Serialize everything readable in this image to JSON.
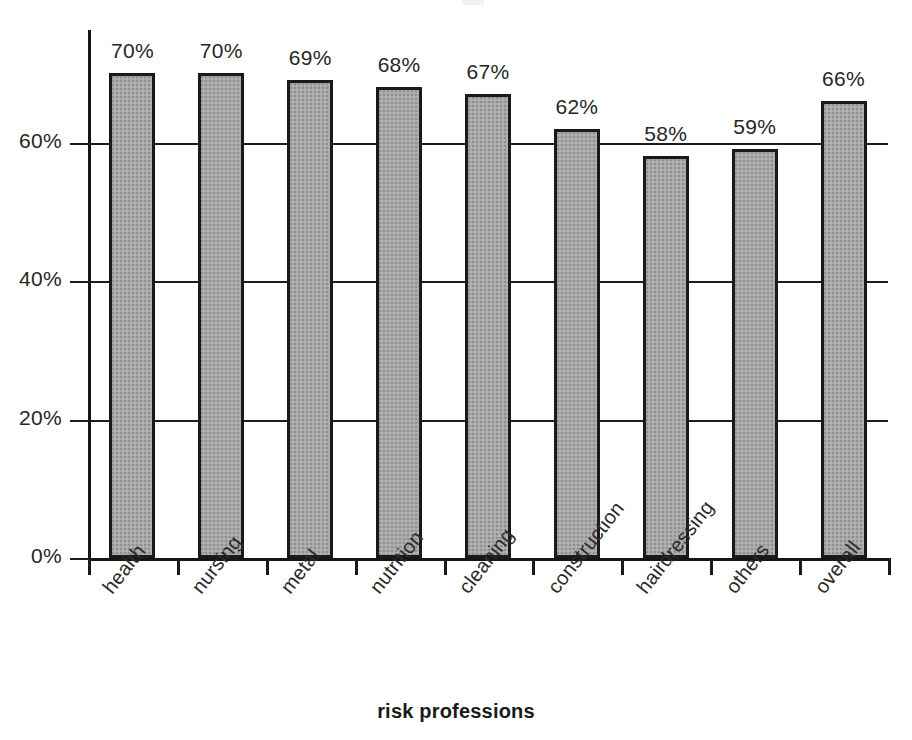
{
  "chart_data": {
    "type": "bar",
    "title": "",
    "subtitle": "",
    "xlabel": "risk professions",
    "ylabel": "",
    "categories": [
      "health",
      "nursing",
      "metal",
      "nutrition",
      "cleaning",
      "construction",
      "hairdressing",
      "others",
      "overall"
    ],
    "values": [
      70,
      70,
      69,
      68,
      67,
      62,
      58,
      59,
      66
    ],
    "value_labels": [
      "70%",
      "70%",
      "69%",
      "68%",
      "67%",
      "62%",
      "58%",
      "59%",
      "66%"
    ],
    "ylim": [
      0,
      70
    ],
    "yticks": [
      0,
      20,
      40,
      60
    ],
    "ytick_labels": [
      "0%",
      "20%",
      "40%",
      "60%"
    ],
    "grid": true,
    "grid_axis": "y",
    "legend": "none",
    "series": [
      {
        "name": "share of risk professions",
        "values": [
          70,
          70,
          69,
          68,
          67,
          62,
          58,
          59,
          66
        ]
      }
    ],
    "bar_fill_color": "#a9a9a9",
    "bar_edge_color": "#1a1a1a",
    "axis_color": "#161616",
    "text_color": "#262626",
    "background_color": "#ffffff"
  },
  "axes": {
    "x_title": "risk professions",
    "y_ticks": [
      {
        "label": "60%",
        "value": 60
      },
      {
        "label": "40%",
        "value": 40
      },
      {
        "label": "20%",
        "value": 20
      },
      {
        "label": "0%",
        "value": 0
      }
    ]
  },
  "bars": [
    {
      "category": "health",
      "value": 70,
      "label": "70%"
    },
    {
      "category": "nursing",
      "value": 70,
      "label": "70%"
    },
    {
      "category": "metal",
      "value": 69,
      "label": "69%"
    },
    {
      "category": "nutrition",
      "value": 68,
      "label": "68%"
    },
    {
      "category": "cleaning",
      "value": 67,
      "label": "67%"
    },
    {
      "category": "construction",
      "value": 62,
      "label": "62%"
    },
    {
      "category": "hairdressing",
      "value": 58,
      "label": "58%"
    },
    {
      "category": "others",
      "value": 59,
      "label": "59%"
    },
    {
      "category": "overall",
      "value": 66,
      "label": "66%"
    }
  ]
}
